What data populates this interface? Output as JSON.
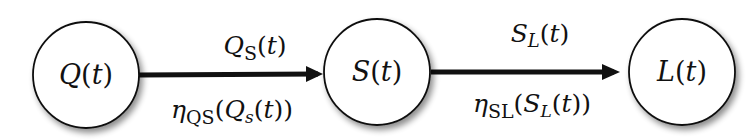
{
  "diagram": {
    "nodes": [
      {
        "id": "Q",
        "label": "Q(t)"
      },
      {
        "id": "S",
        "label": "S(t)"
      },
      {
        "id": "L",
        "label": "L(t)"
      }
    ],
    "edges": [
      {
        "from": "Q",
        "to": "S",
        "top_label": "Q_S(t)",
        "bottom_label": "η_QS(Q_s(t))"
      },
      {
        "from": "S",
        "to": "L",
        "top_label": "S_L(t)",
        "bottom_label": "η_SL(S_L(t))"
      }
    ],
    "colors": {
      "stroke": "#111111",
      "fill": "#ffffff",
      "shadow": "#bdbdbd"
    }
  }
}
